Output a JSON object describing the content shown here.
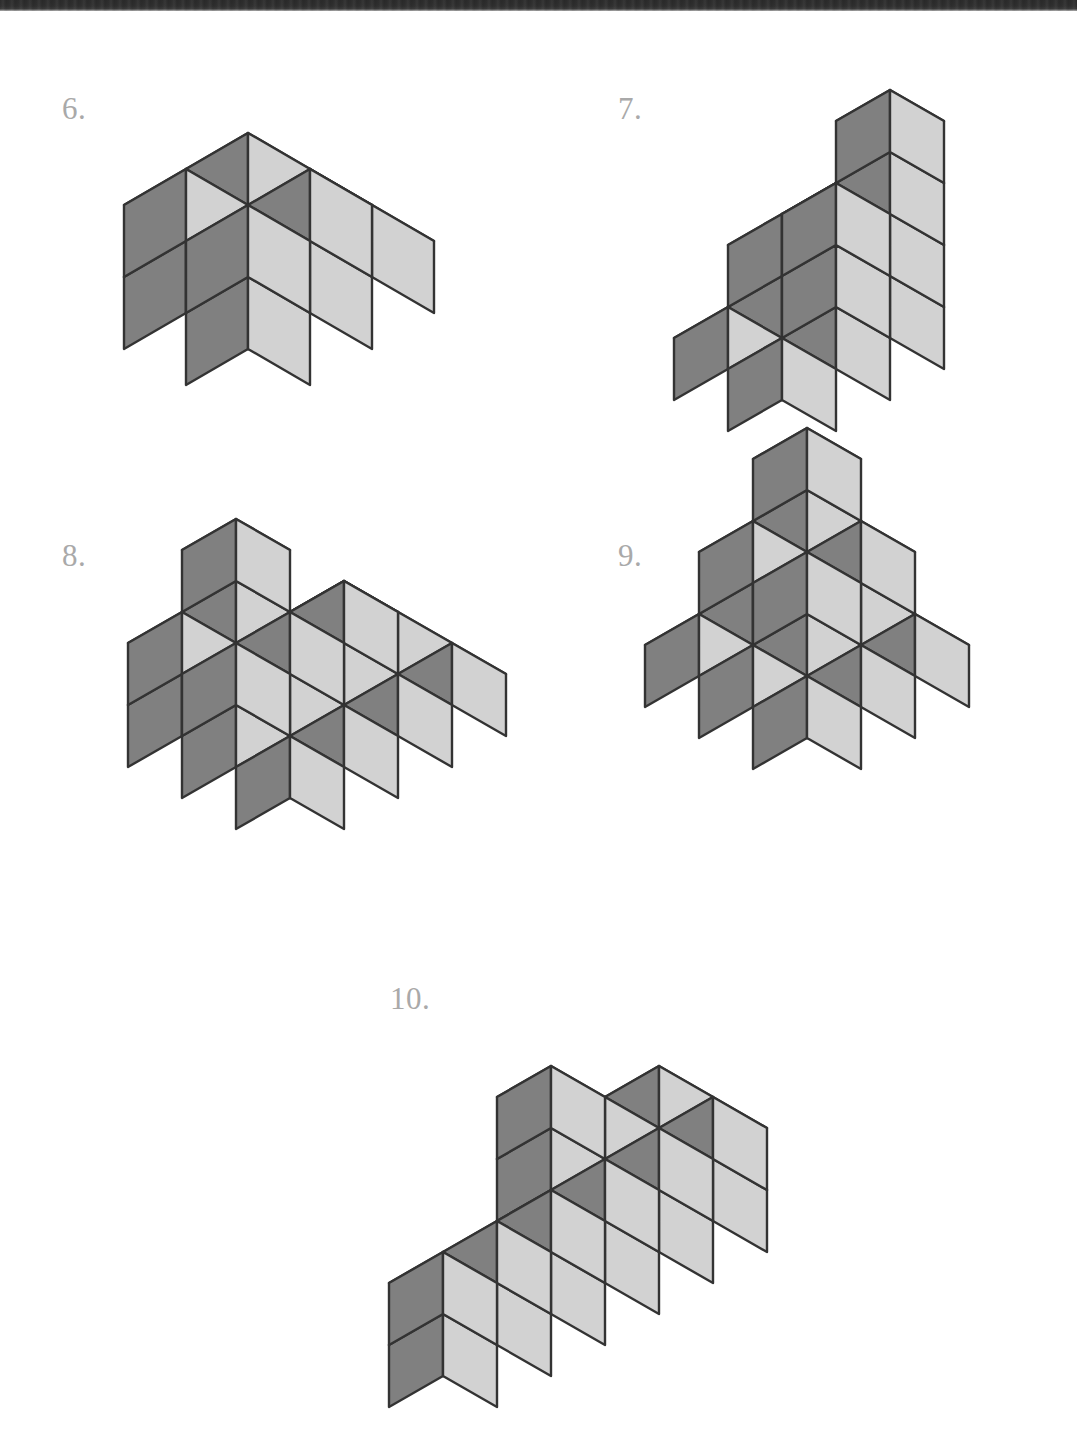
{
  "page": {
    "width": 1077,
    "height": 1445,
    "background": "#ffffff",
    "scan_edge_color": "#2e2e2e",
    "type": "isometric-cube-counting-worksheet"
  },
  "palette": {
    "top_face": "#ffffff",
    "left_face": "#808080",
    "right_face": "#d2d2d2",
    "stroke": "#333333",
    "label_color": "#a9a9a9"
  },
  "figures": [
    {
      "id": "figure-6",
      "label": "6.",
      "label_x": 62,
      "label_y": 93,
      "origin_x": 248,
      "origin_y": 421,
      "half_width": 62,
      "half_depth": 36,
      "cube_height": 72,
      "cube_count": 10,
      "voxels": [
        [
          0,
          0,
          0
        ],
        [
          1,
          0,
          0
        ],
        [
          0,
          1,
          0
        ],
        [
          1,
          1,
          0
        ],
        [
          2,
          0,
          0
        ],
        [
          2,
          1,
          0
        ],
        [
          0,
          0,
          1
        ],
        [
          1,
          0,
          1
        ],
        [
          0,
          1,
          1
        ],
        [
          1,
          1,
          1
        ]
      ]
    },
    {
      "id": "figure-7",
      "label": "7.",
      "label_x": 618,
      "label_y": 93,
      "origin_x": 782,
      "origin_y": 462,
      "half_width": 54,
      "half_depth": 31,
      "cube_height": 62,
      "cube_count": 13,
      "voxels": [
        [
          0,
          0,
          0
        ],
        [
          1,
          0,
          0
        ],
        [
          2,
          0,
          0
        ],
        [
          0,
          1,
          0
        ],
        [
          1,
          1,
          0
        ],
        [
          2,
          1,
          0
        ],
        [
          1,
          0,
          1
        ],
        [
          2,
          0,
          1
        ],
        [
          1,
          1,
          1
        ],
        [
          2,
          1,
          1
        ],
        [
          1,
          0,
          2
        ],
        [
          2,
          0,
          2
        ],
        [
          2,
          0,
          3
        ]
      ]
    },
    {
      "id": "figure-8",
      "label": "8.",
      "label_x": 62,
      "label_y": 540,
      "origin_x": 290,
      "origin_y": 860,
      "half_width": 54,
      "half_depth": 31,
      "cube_height": 62,
      "cube_count": 18,
      "voxels": [
        [
          0,
          0,
          0
        ],
        [
          1,
          0,
          0
        ],
        [
          2,
          0,
          0
        ],
        [
          3,
          0,
          0
        ],
        [
          0,
          1,
          0
        ],
        [
          1,
          1,
          0
        ],
        [
          2,
          1,
          0
        ],
        [
          3,
          1,
          0
        ],
        [
          0,
          2,
          0
        ],
        [
          1,
          2,
          0
        ],
        [
          2,
          2,
          0
        ],
        [
          3,
          2,
          0
        ],
        [
          0,
          1,
          1
        ],
        [
          1,
          1,
          1
        ],
        [
          2,
          1,
          1
        ],
        [
          0,
          2,
          1
        ],
        [
          1,
          2,
          1
        ],
        [
          1,
          2,
          2
        ]
      ]
    },
    {
      "id": "figure-9",
      "label": "9.",
      "label_x": 618,
      "label_y": 540,
      "origin_x": 807,
      "origin_y": 800,
      "half_width": 54,
      "half_depth": 31,
      "cube_height": 62,
      "cube_count": 14,
      "voxels": [
        [
          0,
          0,
          0
        ],
        [
          1,
          0,
          0
        ],
        [
          2,
          0,
          0
        ],
        [
          0,
          1,
          0
        ],
        [
          1,
          1,
          0
        ],
        [
          2,
          1,
          0
        ],
        [
          0,
          2,
          0
        ],
        [
          1,
          2,
          0
        ],
        [
          2,
          2,
          0
        ],
        [
          1,
          1,
          1
        ],
        [
          2,
          1,
          1
        ],
        [
          1,
          2,
          1
        ],
        [
          2,
          2,
          1
        ],
        [
          2,
          2,
          2
        ]
      ]
    },
    {
      "id": "figure-10",
      "label": "10.",
      "label_x": 390,
      "label_y": 983,
      "origin_x": 605,
      "origin_y": 1345,
      "half_width": 54,
      "half_depth": 31,
      "cube_height": 62,
      "cube_count": 15,
      "voxels": [
        [
          0,
          0,
          0
        ],
        [
          1,
          0,
          0
        ],
        [
          2,
          0,
          0
        ],
        [
          0,
          1,
          0
        ],
        [
          1,
          1,
          0
        ],
        [
          2,
          1,
          0
        ],
        [
          -1,
          0,
          0
        ],
        [
          -2,
          0,
          0
        ],
        [
          -3,
          0,
          0
        ],
        [
          0,
          0,
          1
        ],
        [
          1,
          0,
          1
        ],
        [
          2,
          0,
          1
        ],
        [
          0,
          1,
          1
        ],
        [
          1,
          1,
          1
        ],
        [
          2,
          1,
          1
        ],
        [
          -1,
          0,
          1
        ],
        [
          -2,
          0,
          1
        ],
        [
          -3,
          0,
          1
        ],
        [
          0,
          1,
          2
        ]
      ]
    }
  ]
}
